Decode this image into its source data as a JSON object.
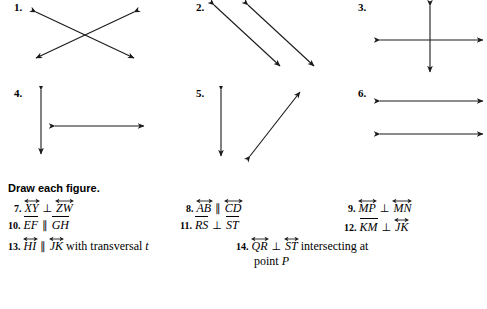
{
  "worksheet": {
    "instruction": "Draw each figure.",
    "figures": [
      {
        "num": "1.",
        "name": "two-intersecting-lines-x-shape",
        "description": "Two double-headed arrows crossing in an X"
      },
      {
        "num": "2.",
        "name": "two-parallel-diagonal-lines",
        "description": "Two parallel double-headed diagonal arrows"
      },
      {
        "num": "3.",
        "name": "perpendicular-cross-lines",
        "description": "Vertical and horizontal double-headed arrows crossing perpendicularly"
      },
      {
        "num": "4.",
        "name": "vertical-and-horizontal-lines-t-shape",
        "description": "Vertical double-headed arrow with separate horizontal double-headed arrow"
      },
      {
        "num": "5.",
        "name": "vertical-and-diagonal-lines",
        "description": "Vertical double-headed arrow with separate diagonal double-headed arrow"
      },
      {
        "num": "6.",
        "name": "two-parallel-horizontal-lines",
        "description": "Two parallel horizontal double-headed arrows"
      }
    ],
    "problems": [
      {
        "num": "7.",
        "parts": [
          {
            "kind": "line",
            "text": "XY"
          },
          {
            "kind": "symbol",
            "text": "⊥"
          },
          {
            "kind": "line",
            "text": "ZW"
          }
        ]
      },
      {
        "num": "8.",
        "parts": [
          {
            "kind": "line",
            "text": "AB"
          },
          {
            "kind": "symbol",
            "text": "∥"
          },
          {
            "kind": "line",
            "text": "CD"
          }
        ]
      },
      {
        "num": "9.",
        "parts": [
          {
            "kind": "line",
            "text": "MP"
          },
          {
            "kind": "symbol",
            "text": "⊥"
          },
          {
            "kind": "line",
            "text": "MN"
          }
        ]
      },
      {
        "num": "10.",
        "parts": [
          {
            "kind": "segment",
            "text": "EF"
          },
          {
            "kind": "symbol",
            "text": "∥"
          },
          {
            "kind": "segment",
            "text": "GH"
          }
        ]
      },
      {
        "num": "11.",
        "parts": [
          {
            "kind": "segment",
            "text": "RS"
          },
          {
            "kind": "symbol",
            "text": "⊥"
          },
          {
            "kind": "segment",
            "text": "ST"
          }
        ]
      },
      {
        "num": "12.",
        "parts": [
          {
            "kind": "segment",
            "text": "KM"
          },
          {
            "kind": "symbol",
            "text": "⊥"
          },
          {
            "kind": "line",
            "text": "JK"
          }
        ]
      },
      {
        "num": "13.",
        "parts": [
          {
            "kind": "line",
            "text": "HI"
          },
          {
            "kind": "symbol",
            "text": "∥"
          },
          {
            "kind": "line",
            "text": "JK"
          },
          {
            "kind": "plain",
            "text": "with transversal"
          },
          {
            "kind": "italic",
            "text": "t"
          }
        ]
      },
      {
        "num": "14.",
        "parts": [
          {
            "kind": "line",
            "text": "QR"
          },
          {
            "kind": "symbol",
            "text": "⊥"
          },
          {
            "kind": "line",
            "text": "ST"
          },
          {
            "kind": "plain",
            "text": "intersecting at"
          }
        ],
        "second_line": [
          {
            "kind": "plain",
            "text": "point"
          },
          {
            "kind": "italic",
            "text": "P"
          }
        ]
      }
    ],
    "colors": {
      "ink": "#1a1a1a",
      "paper": "#ffffff"
    }
  }
}
